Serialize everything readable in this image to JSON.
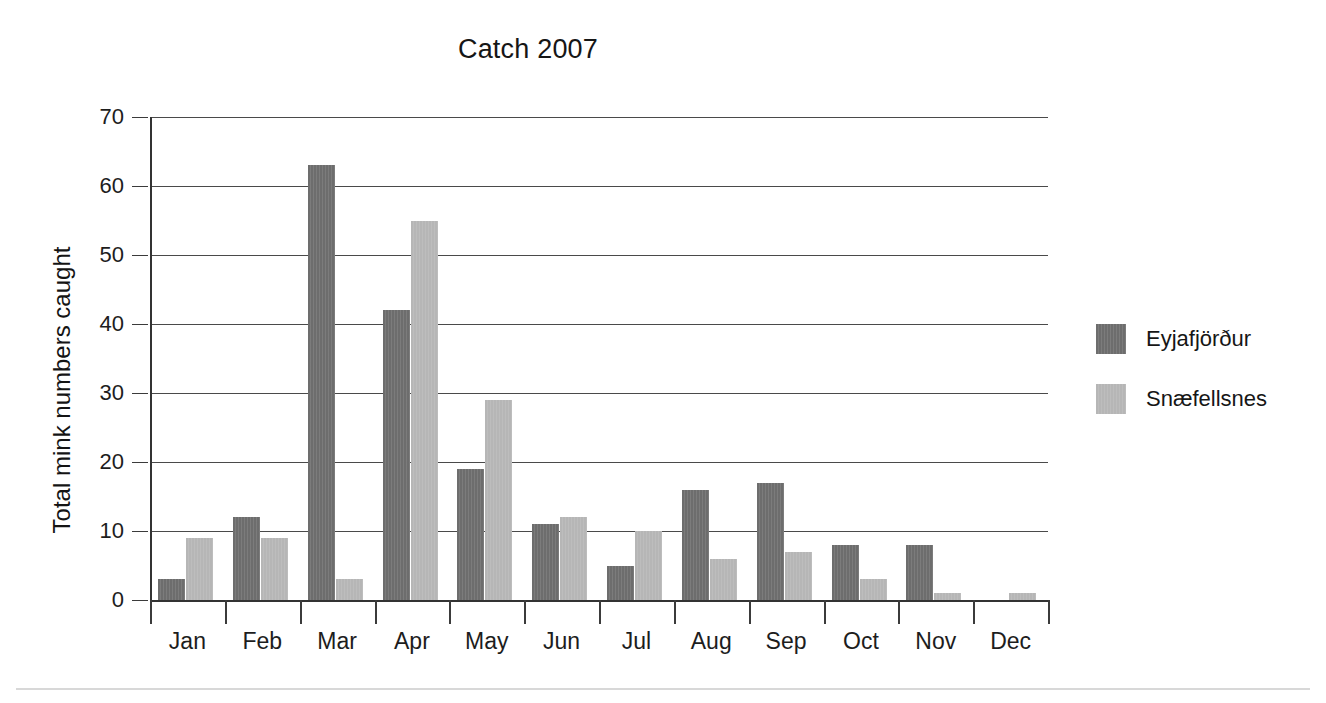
{
  "chart_data": {
    "type": "bar",
    "title": "Catch 2007",
    "xlabel": "",
    "ylabel": "Total mink numbers caught",
    "categories": [
      "Jan",
      "Feb",
      "Mar",
      "Apr",
      "May",
      "Jun",
      "Jul",
      "Aug",
      "Sep",
      "Oct",
      "Nov",
      "Dec"
    ],
    "series": [
      {
        "name": "Eyjafjörður",
        "color": "#6d6d6d",
        "values": [
          3,
          12,
          63,
          42,
          19,
          11,
          5,
          16,
          17,
          8,
          8,
          0
        ]
      },
      {
        "name": "Snæfellsnes",
        "color": "#b6b6b6",
        "values": [
          9,
          9,
          3,
          55,
          29,
          12,
          10,
          6,
          7,
          3,
          1,
          1
        ]
      }
    ],
    "ylim": [
      0,
      70
    ],
    "yticks": [
      0,
      10,
      20,
      30,
      40,
      50,
      60,
      70
    ],
    "ytick_labels": [
      "0",
      "10",
      "20",
      "30",
      "40",
      "50",
      "60",
      "70"
    ],
    "grid": true,
    "legend_position": "right"
  },
  "legend": {
    "entries": [
      {
        "label": "Eyjafjörður",
        "color": "#6d6d6d",
        "swatch_name": "legend-swatch-eyjafjordur"
      },
      {
        "label": "Snæfellsnes",
        "color": "#b6b6b6",
        "swatch_name": "legend-swatch-snaefellsnes"
      }
    ]
  }
}
